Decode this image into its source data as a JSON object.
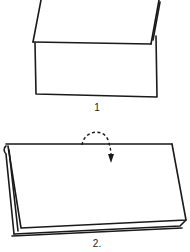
{
  "diagram": {
    "type": "paper-folding-instructions",
    "steps": [
      {
        "number_label": "1",
        "description": "Top flap folded down over lower section"
      },
      {
        "number_label": "2.",
        "description": "Folded sheet with dashed arrow indicating fold toward back"
      }
    ],
    "colors": {
      "line": "#1a1a1a",
      "background": "#ffffff"
    },
    "icons": {
      "fold_arrow": "dashed-curved-arrow-icon"
    }
  }
}
